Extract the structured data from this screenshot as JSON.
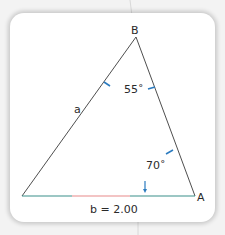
{
  "diagram": {
    "vertices": {
      "B": "B",
      "A": "A"
    },
    "sides": {
      "a": "a",
      "b": "b = 2.00"
    },
    "angles": {
      "angle_B": "55˚",
      "angle_A": "70˚"
    },
    "colors": {
      "stroke": "#3a3a3a",
      "angle_marker": "#2b7bbf",
      "base_left": "#3a8f8a",
      "base_middle": "#e88a8a",
      "base_right": "#3a8f8a"
    }
  }
}
